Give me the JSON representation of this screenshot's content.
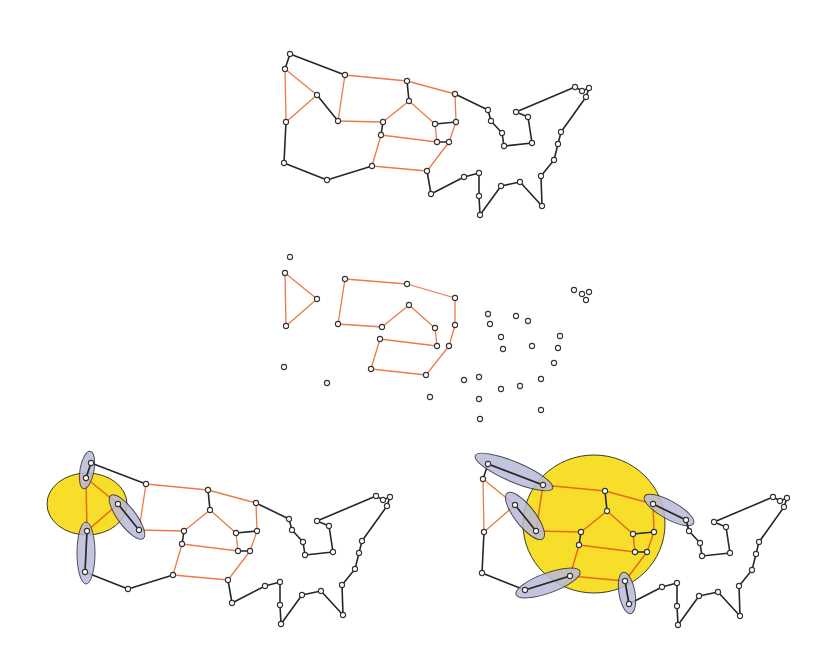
{
  "figure": {
    "colors": {
      "background": "#ffffff",
      "black_edge": "#262626",
      "orange_edge": "#ec7a48",
      "node_fill": "#ffffff",
      "node_stroke": "#333333",
      "cluster_fill": "#f6de2a",
      "pair_fill": "#b9bad8"
    },
    "node_radius": 2.6
  },
  "template_nodes": {
    "A": [
      290,
      54
    ],
    "B": [
      285,
      69
    ],
    "C": [
      345,
      75
    ],
    "D": [
      317,
      95
    ],
    "E": [
      286,
      122
    ],
    "F": [
      338,
      121
    ],
    "G": [
      407,
      81
    ],
    "H": [
      409,
      101
    ],
    "I": [
      383,
      122
    ],
    "J": [
      381,
      135
    ],
    "K": [
      455,
      94
    ],
    "L": [
      435,
      124
    ],
    "M": [
      456,
      122
    ],
    "N": [
      437,
      142
    ],
    "O": [
      449,
      142
    ],
    "BL": [
      284,
      163
    ],
    "BB": [
      327,
      180
    ],
    "BC": [
      372,
      166
    ],
    "P": [
      427,
      171
    ],
    "Q": [
      431,
      194
    ],
    "R": [
      464,
      177
    ],
    "S": [
      479,
      173
    ],
    "T": [
      479,
      196
    ],
    "U": [
      480,
      215
    ],
    "V": [
      501,
      186
    ],
    "W": [
      520,
      182
    ],
    "X": [
      541,
      176
    ],
    "Y": [
      542,
      206
    ],
    "Z": [
      488,
      110
    ],
    "AA": [
      491,
      121
    ],
    "AB": [
      502,
      133
    ],
    "AC": [
      504,
      146
    ],
    "AD": [
      532,
      143
    ],
    "AE": [
      528,
      117
    ],
    "AF": [
      516,
      112
    ],
    "AG": [
      575,
      87
    ],
    "AG2": [
      582,
      91
    ],
    "AG3": [
      589,
      88
    ],
    "AG4": [
      586,
      97
    ],
    "AH": [
      561,
      132
    ],
    "AI": [
      558,
      144
    ],
    "AJ": [
      554,
      160
    ]
  },
  "edges": {
    "orange": [
      [
        "B",
        "D"
      ],
      [
        "B",
        "E"
      ],
      [
        "D",
        "E"
      ],
      [
        "C",
        "F"
      ],
      [
        "C",
        "G"
      ],
      [
        "F",
        "I"
      ],
      [
        "I",
        "H"
      ],
      [
        "H",
        "L"
      ],
      [
        "G",
        "K"
      ],
      [
        "K",
        "M"
      ],
      [
        "L",
        "N"
      ],
      [
        "J",
        "N"
      ],
      [
        "M",
        "O"
      ],
      [
        "O",
        "P"
      ],
      [
        "J",
        "BC"
      ],
      [
        "BC",
        "P"
      ]
    ],
    "black": [
      [
        "A",
        "B"
      ],
      [
        "A",
        "C"
      ],
      [
        "D",
        "F"
      ],
      [
        "G",
        "H"
      ],
      [
        "I",
        "J"
      ],
      [
        "L",
        "M"
      ],
      [
        "N",
        "O"
      ],
      [
        "E",
        "BL"
      ],
      [
        "BL",
        "BB"
      ],
      [
        "BB",
        "BC"
      ],
      [
        "P",
        "Q"
      ],
      [
        "Q",
        "R"
      ],
      [
        "R",
        "S"
      ],
      [
        "S",
        "T"
      ],
      [
        "T",
        "U"
      ],
      [
        "U",
        "V"
      ],
      [
        "V",
        "W"
      ],
      [
        "W",
        "Y"
      ],
      [
        "Y",
        "X"
      ],
      [
        "X",
        "AJ"
      ],
      [
        "AJ",
        "AI"
      ],
      [
        "AI",
        "AH"
      ],
      [
        "AH",
        "AG4"
      ],
      [
        "AG4",
        "AG3"
      ],
      [
        "AG3",
        "AG2"
      ],
      [
        "AG2",
        "AG"
      ],
      [
        "AG",
        "AF"
      ],
      [
        "AF",
        "AE"
      ],
      [
        "AE",
        "AD"
      ],
      [
        "AD",
        "AC"
      ],
      [
        "AC",
        "AB"
      ],
      [
        "AB",
        "AA"
      ],
      [
        "AA",
        "Z"
      ],
      [
        "Z",
        "K"
      ]
    ]
  },
  "panels": [
    {
      "id": "top",
      "label": "full-graph",
      "offset": [
        0,
        0
      ],
      "show_black": true,
      "show_orange": true,
      "isolated_nodes": []
    },
    {
      "id": "middle",
      "label": "orange-subgraph",
      "offset": [
        0,
        0
      ],
      "show_black": false,
      "show_orange": true,
      "custom_nodes": {
        "A": [
          290,
          257
        ],
        "B": [
          285,
          273
        ],
        "C": [
          345,
          279
        ],
        "D": [
          317,
          299
        ],
        "E": [
          286,
          326
        ],
        "F": [
          338,
          324
        ],
        "G": [
          407,
          284
        ],
        "H": [
          409,
          305
        ],
        "I": [
          382,
          327
        ],
        "J": [
          380,
          339
        ],
        "K": [
          455,
          298
        ],
        "L": [
          435,
          328
        ],
        "M": [
          455,
          325
        ],
        "N": [
          437,
          346
        ],
        "O": [
          449,
          346
        ],
        "BL": [
          284,
          367
        ],
        "BB": [
          327,
          383
        ],
        "BC": [
          371,
          369
        ],
        "P": [
          426,
          375
        ],
        "Q": [
          430,
          397
        ],
        "R": [
          464,
          380
        ],
        "S": [
          479,
          377
        ],
        "T": [
          479,
          399
        ],
        "U": [
          480,
          419
        ],
        "V": [
          501,
          389
        ],
        "W": [
          520,
          386
        ],
        "X": [
          541,
          379
        ],
        "Y": [
          541,
          410
        ],
        "Z": [
          488,
          314
        ],
        "AA": [
          490,
          324
        ],
        "AB": [
          501,
          337
        ],
        "AC": [
          503,
          349
        ],
        "AD": [
          532,
          346
        ],
        "AE": [
          528,
          321
        ],
        "AF": [
          516,
          316
        ],
        "AG": [
          574,
          290
        ],
        "AG2": [
          582,
          294
        ],
        "AG3": [
          589,
          292
        ],
        "AG4": [
          586,
          300
        ],
        "AH": [
          560,
          336
        ],
        "AI": [
          558,
          348
        ],
        "AJ": [
          554,
          363
        ]
      }
    },
    {
      "id": "bottom-left",
      "label": "contraction-example-small",
      "offset": [
        -199,
        409
      ],
      "show_black": true,
      "show_orange": true,
      "cluster": {
        "type": "ellipse",
        "cx": 87,
        "cy": 504,
        "rx": 40,
        "ry": 31
      },
      "pairs": [
        {
          "cx": 87,
          "cy": 470,
          "rx": 19,
          "ry": 7,
          "angle": 100
        },
        {
          "cx": 127,
          "cy": 517,
          "rx": 27,
          "ry": 9,
          "angle": 53
        },
        {
          "cx": 86,
          "cy": 553,
          "rx": 31,
          "ry": 9,
          "angle": 90
        }
      ]
    },
    {
      "id": "bottom-right",
      "label": "contraction-example-large",
      "offset": [
        198,
        410
      ],
      "show_black": true,
      "show_orange": true,
      "cluster": {
        "type": "ellipse",
        "cx": 594,
        "cy": 524,
        "rx": 71,
        "ry": 69
      },
      "pairs": [
        {
          "cx": 514,
          "cy": 472,
          "rx": 42,
          "ry": 10,
          "angle": 23
        },
        {
          "cx": 525,
          "cy": 516,
          "rx": 29,
          "ry": 10,
          "angle": 52
        },
        {
          "cx": 548,
          "cy": 583,
          "rx": 34,
          "ry": 10,
          "angle": -20
        },
        {
          "cx": 669,
          "cy": 510,
          "rx": 28,
          "ry": 9,
          "angle": 29
        },
        {
          "cx": 627,
          "cy": 593,
          "rx": 21,
          "ry": 8,
          "angle": 80
        }
      ]
    }
  ]
}
